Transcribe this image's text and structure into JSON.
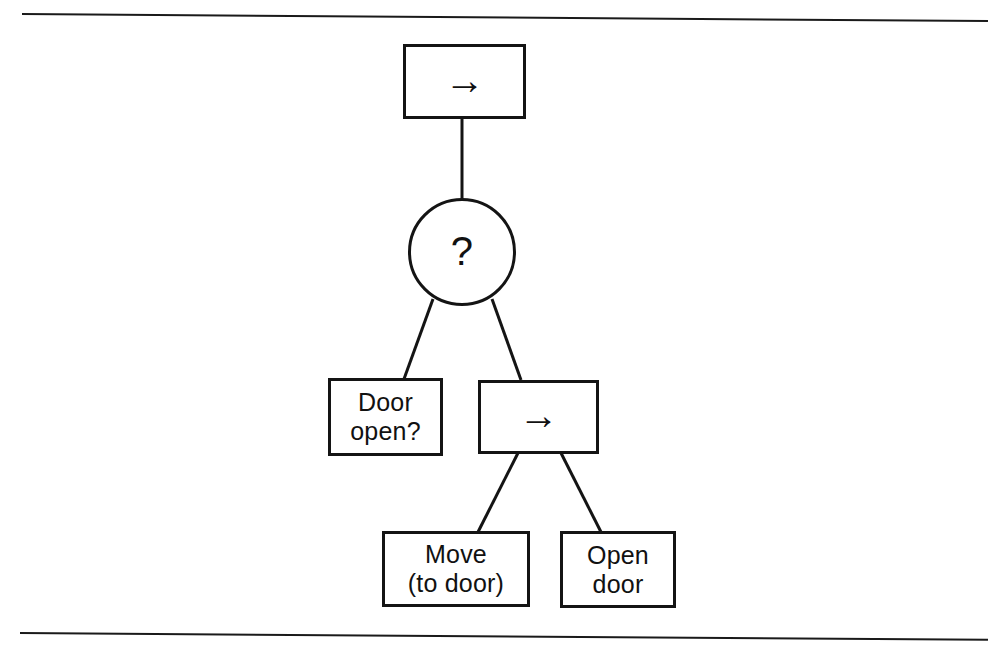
{
  "page": {
    "background_color": "#ffffff",
    "ink_color": "#141414",
    "rules": [
      {
        "name": "top-rule"
      },
      {
        "name": "bottom-rule"
      }
    ]
  },
  "diagram": {
    "type": "behavior-tree",
    "nodes": [
      {
        "id": "root",
        "shape": "rectangle",
        "label": "→",
        "icon": "right-arrow-glyph",
        "role": "sequence"
      },
      {
        "id": "selector",
        "shape": "circle",
        "label": "?",
        "icon": "question-mark-glyph",
        "role": "selector"
      },
      {
        "id": "door-open",
        "shape": "rectangle",
        "label": "Door\nopen?",
        "role": "condition"
      },
      {
        "id": "sequence",
        "shape": "rectangle",
        "label": "→",
        "icon": "right-arrow-glyph",
        "role": "sequence"
      },
      {
        "id": "move-to-door",
        "shape": "rectangle",
        "label": "Move\n(to door)",
        "role": "action"
      },
      {
        "id": "open-door",
        "shape": "rectangle",
        "label": "Open\ndoor",
        "role": "action"
      }
    ],
    "edges": [
      {
        "from": "root",
        "to": "selector"
      },
      {
        "from": "selector",
        "to": "door-open"
      },
      {
        "from": "selector",
        "to": "sequence"
      },
      {
        "from": "sequence",
        "to": "move-to-door"
      },
      {
        "from": "sequence",
        "to": "open-door"
      }
    ]
  }
}
